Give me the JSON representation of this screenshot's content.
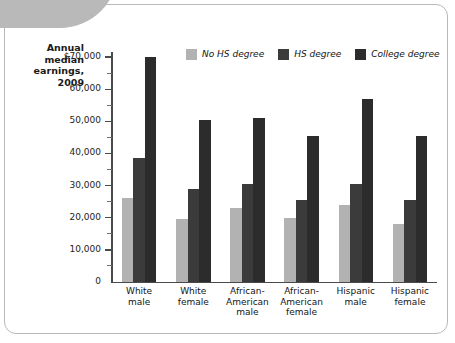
{
  "chart_data": {
    "type": "bar",
    "title": "",
    "xlabel": "",
    "ylabel": "Annual median earnings, 2009",
    "ylim": [
      0,
      73000
    ],
    "grid": false,
    "legend_position": "top",
    "categories": [
      "White male",
      "White female",
      "African-American male",
      "African-American female",
      "Hispanic male",
      "Hispanic female"
    ],
    "category_lines": [
      [
        "White",
        "male"
      ],
      [
        "White",
        "female"
      ],
      [
        "African-",
        "American",
        "male"
      ],
      [
        "African-",
        "American",
        "female"
      ],
      [
        "Hispanic",
        "male"
      ],
      [
        "Hispanic",
        "female"
      ]
    ],
    "series": [
      {
        "name": "No HS degree",
        "color": "#b2b2b2",
        "values": [
          26000,
          19500,
          23000,
          20000,
          24000,
          18000
        ]
      },
      {
        "name": "HS degree",
        "color": "#3b3b3b",
        "values": [
          38500,
          29000,
          30500,
          25500,
          30500,
          25500
        ]
      },
      {
        "name": "College degree",
        "color": "#2c2c2c",
        "values": [
          70000,
          50500,
          51000,
          45500,
          57000,
          45500
        ]
      }
    ],
    "y_ticks": [
      0,
      10000,
      20000,
      30000,
      40000,
      50000,
      60000,
      70000
    ],
    "y_tick_labels": [
      "0",
      "10,000",
      "20,000",
      "30,000",
      "40,000",
      "50,000",
      "60,000",
      "$70,000"
    ],
    "y_minor_ticks": [
      5000,
      15000,
      25000,
      35000,
      45000,
      55000,
      65000
    ]
  },
  "axis_title": {
    "line1": "Annual",
    "line2": "median",
    "line3": "earnings,",
    "line4": "2009"
  }
}
